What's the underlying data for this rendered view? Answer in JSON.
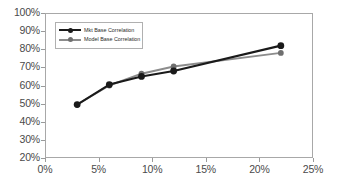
{
  "chart_data": {
    "type": "line",
    "title": "",
    "subtitle": "",
    "xlabel": "",
    "ylabel": "",
    "xlim": [
      0,
      25
    ],
    "ylim": [
      20,
      100
    ],
    "xticks": [
      "0%",
      "5%",
      "10%",
      "15%",
      "20%",
      "25%"
    ],
    "xtick_values": [
      0,
      5,
      10,
      15,
      20,
      25
    ],
    "yticks": [
      "20%",
      "30%",
      "40%",
      "50%",
      "60%",
      "70%",
      "80%",
      "90%",
      "100%"
    ],
    "ytick_values": [
      20,
      30,
      40,
      50,
      60,
      70,
      80,
      90,
      100
    ],
    "grid": false,
    "legend_position": "upper-left-inside",
    "x": [
      3,
      6,
      9,
      12,
      22
    ],
    "series": [
      {
        "name": "Mkt Base Correlation",
        "color": "#1a1a1a",
        "marker": "circle",
        "values": [
          49.5,
          60.5,
          65.0,
          68.0,
          82.0
        ]
      },
      {
        "name": "Model Base Correlation",
        "color": "#8c8c8c",
        "marker": "circle",
        "values": [
          49.5,
          60.0,
          66.5,
          70.5,
          78.0
        ]
      }
    ]
  },
  "legend": {
    "items": [
      {
        "label": "Mkt Base Correlation"
      },
      {
        "label": "Model Base Correlation"
      }
    ]
  },
  "colors": {
    "series_mkt": "#1a1a1a",
    "series_model": "#8c8c8c",
    "axis": "#a8a8a8",
    "tick_text": "#4a4a4a",
    "background": "#ffffff"
  }
}
